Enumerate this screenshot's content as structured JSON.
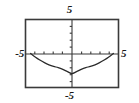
{
  "figure": {
    "kind": "graphing-calculator-viewport",
    "background_color": "#ffffff",
    "frame_color": "#3a3a3a",
    "axis_color": "#3a3a3a",
    "curve_color": "#2b2b2b"
  },
  "labels": {
    "top": "5",
    "bottom": "-5",
    "left": "-5",
    "right": "5"
  },
  "chart_data": {
    "type": "line",
    "title": "",
    "xlabel": "",
    "ylabel": "",
    "xlim": [
      -5,
      5
    ],
    "ylim": [
      -5,
      5
    ],
    "grid": false,
    "legend": null,
    "axes": {
      "x_axis_at_y": 0,
      "y_axis_at_x": 0,
      "tick_spacing_x": 1,
      "tick_spacing_y": 1,
      "tick_style": "dashes-on-axis",
      "x_ticks": [
        -4,
        -3,
        -2,
        -1,
        1,
        2,
        3,
        4
      ],
      "y_ticks": [
        -4,
        -3,
        -2,
        -1,
        1,
        2,
        3,
        4
      ]
    },
    "tick_labels": {
      "xmin": "-5",
      "xmax": "5",
      "ymin": "-5",
      "ymax": "5"
    },
    "series": [
      {
        "name": "parabola",
        "shape": "upward-opening parabola",
        "vertex": [
          0,
          -3
        ],
        "roots": [
          -4.5,
          4.5
        ],
        "x": [
          -4.5,
          -4.0,
          -3.5,
          -3.0,
          -2.5,
          -2.0,
          -1.5,
          -1.0,
          -0.5,
          0.0,
          0.5,
          1.0,
          1.5,
          2.0,
          2.5,
          3.0,
          3.5,
          4.0,
          4.5
        ],
        "y": [
          0.0,
          -0.52,
          -0.98,
          -1.37,
          -1.69,
          -1.93,
          -2.11,
          -2.37,
          -2.7,
          -3.0,
          -2.7,
          -2.37,
          -2.11,
          -1.93,
          -1.69,
          -1.37,
          -0.98,
          -0.52,
          0.0
        ]
      }
    ]
  }
}
